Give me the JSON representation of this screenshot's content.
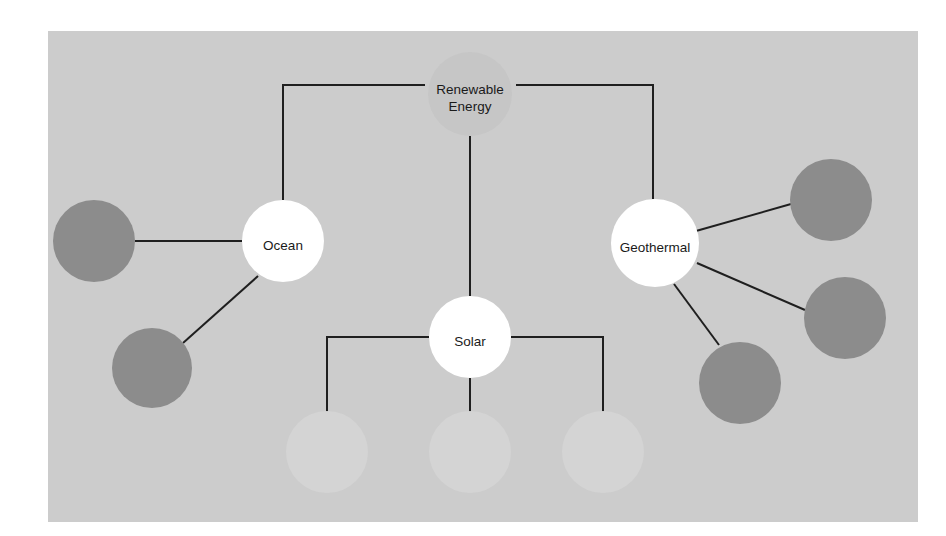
{
  "canvas": {
    "background_color": "#cccccc",
    "page_background_color": "#ffffff",
    "x": 48,
    "y": 31,
    "width": 870,
    "height": 491
  },
  "style": {
    "edge_color": "#1f1f1f",
    "edge_width": 2,
    "hub_node_color": "#ffffff",
    "leaf_node_color": "#8c8c8c",
    "faint_node_color": "#d4d4d4",
    "root_node_color": "#c6c6c6",
    "label_color": "#1a1a1a"
  },
  "diagram": {
    "type": "node-link-tree",
    "title_node": "Renewable Energy",
    "nodes": [
      {
        "id": "renewable-energy",
        "label": "Renewable Energy",
        "label_lines": [
          "Renewable",
          "Energy"
        ],
        "kind": "root",
        "cx": 470,
        "cy": 94,
        "r": 42,
        "color": "#c6c6c6",
        "labeled": true
      },
      {
        "id": "ocean",
        "label": "Ocean",
        "label_lines": [
          "Ocean"
        ],
        "kind": "hub",
        "cx": 283,
        "cy": 241,
        "r": 41,
        "color": "#ffffff",
        "labeled": true
      },
      {
        "id": "geothermal",
        "label": "Geothermal",
        "label_lines": [
          "Geothermal"
        ],
        "kind": "hub",
        "cx": 655,
        "cy": 243,
        "r": 44,
        "color": "#ffffff",
        "labeled": true
      },
      {
        "id": "solar",
        "label": "Solar",
        "label_lines": [
          "Solar"
        ],
        "kind": "hub",
        "cx": 470,
        "cy": 337,
        "r": 41,
        "color": "#ffffff",
        "labeled": true
      },
      {
        "id": "ocean-leaf-1",
        "label": "",
        "kind": "leaf",
        "cx": 94,
        "cy": 241,
        "r": 41,
        "color": "#8c8c8c",
        "labeled": false
      },
      {
        "id": "ocean-leaf-2",
        "label": "",
        "kind": "leaf",
        "cx": 152,
        "cy": 368,
        "r": 40,
        "color": "#8c8c8c",
        "labeled": false
      },
      {
        "id": "geothermal-leaf-1",
        "label": "",
        "kind": "leaf",
        "cx": 831,
        "cy": 200,
        "r": 41,
        "color": "#8c8c8c",
        "labeled": false
      },
      {
        "id": "geothermal-leaf-2",
        "label": "",
        "kind": "leaf",
        "cx": 845,
        "cy": 318,
        "r": 41,
        "color": "#8c8c8c",
        "labeled": false
      },
      {
        "id": "geothermal-leaf-3",
        "label": "",
        "kind": "leaf",
        "cx": 740,
        "cy": 383,
        "r": 41,
        "color": "#8c8c8c",
        "labeled": false
      },
      {
        "id": "solar-leaf-1",
        "label": "",
        "kind": "faint-leaf",
        "cx": 327,
        "cy": 452,
        "r": 41,
        "color": "#d4d4d4",
        "labeled": false
      },
      {
        "id": "solar-leaf-2",
        "label": "",
        "kind": "faint-leaf",
        "cx": 470,
        "cy": 452,
        "r": 41,
        "color": "#d4d4d4",
        "labeled": false
      },
      {
        "id": "solar-leaf-3",
        "label": "",
        "kind": "faint-leaf",
        "cx": 603,
        "cy": 452,
        "r": 41,
        "color": "#d4d4d4",
        "labeled": false
      }
    ],
    "edges": [
      {
        "id": "edge-root-ocean",
        "from": "renewable-energy",
        "to": "ocean",
        "shape": "elbow",
        "path": "M 425 85 L 283 85 L 283 200"
      },
      {
        "id": "edge-root-geothermal",
        "from": "renewable-energy",
        "to": "geothermal",
        "shape": "elbow",
        "path": "M 516 85 L 653 85 L 653 199"
      },
      {
        "id": "edge-root-solar",
        "from": "renewable-energy",
        "to": "solar",
        "shape": "straight",
        "path": "M 470 136 L 470 296"
      },
      {
        "id": "edge-ocean-leaf1",
        "from": "ocean",
        "to": "ocean-leaf-1",
        "shape": "straight",
        "path": "M 242 241 L 135 241"
      },
      {
        "id": "edge-ocean-leaf2",
        "from": "ocean",
        "to": "ocean-leaf-2",
        "shape": "straight",
        "path": "M 258 276 L 183 343"
      },
      {
        "id": "edge-geothermal-leaf1",
        "from": "geothermal",
        "to": "geothermal-leaf-1",
        "shape": "straight",
        "path": "M 696 231 L 791 204"
      },
      {
        "id": "edge-geothermal-leaf2",
        "from": "geothermal",
        "to": "geothermal-leaf-2",
        "shape": "straight",
        "path": "M 697 263 L 805 310"
      },
      {
        "id": "edge-geothermal-leaf3",
        "from": "geothermal",
        "to": "geothermal-leaf-3",
        "shape": "straight",
        "path": "M 674 284 L 719 345"
      },
      {
        "id": "edge-solar-leaf1",
        "from": "solar",
        "to": "solar-leaf-1",
        "shape": "elbow",
        "path": "M 429 337 L 327 337 L 327 413"
      },
      {
        "id": "edge-solar-leaf2",
        "from": "solar",
        "to": "solar-leaf-2",
        "shape": "straight",
        "path": "M 470 378 L 470 413"
      },
      {
        "id": "edge-solar-leaf3",
        "from": "solar",
        "to": "solar-leaf-3",
        "shape": "elbow",
        "path": "M 511 337 L 603 337 L 603 413"
      }
    ]
  }
}
